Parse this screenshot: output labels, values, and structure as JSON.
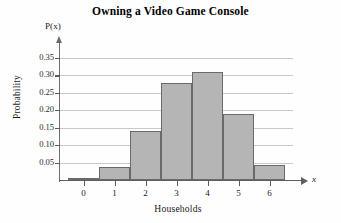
{
  "chart_data": {
    "type": "bar",
    "title": "Owning a Video Game Console",
    "xlabel": "Households",
    "ylabel": "Probability",
    "x_variable": "x",
    "y_variable": "P(x)",
    "categories": [
      "0",
      "1",
      "2",
      "3",
      "4",
      "5",
      "6"
    ],
    "values": [
      0.003,
      0.038,
      0.14,
      0.277,
      0.311,
      0.188,
      0.043
    ],
    "ylim": [
      0,
      0.35
    ],
    "xlim": [
      -0.5,
      6.5
    ],
    "y_ticks": [
      "0.05",
      "0.10",
      "0.15",
      "0.20",
      "0.25",
      "0.30",
      "0.35"
    ],
    "y_tick_values": [
      0.05,
      0.1,
      0.15,
      0.2,
      0.25,
      0.3,
      0.35
    ],
    "x_ticks": [
      "0",
      "1",
      "2",
      "3",
      "4",
      "5",
      "6"
    ],
    "grid": "horizontal",
    "legend": "none",
    "bar_fill_color": "#b5b5b5",
    "bar_border_color": "#6a6a6a",
    "gridline_color": "#c9c9c9",
    "axis_color": "#5f5f5f",
    "background_color": "#fefefe"
  }
}
